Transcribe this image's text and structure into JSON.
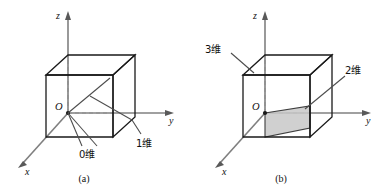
{
  "figure": {
    "background_color": "#ffffff",
    "line_color": "#1a1a1a",
    "axis_color": "#808080",
    "hidden_edge_color": "#8c8c8c",
    "plane_fill_color": "#c8c8c8",
    "panels": [
      {
        "id": "panel-a",
        "caption": "(a)",
        "axes": {
          "z_label": "z",
          "y_label": "y",
          "x_label": "x"
        },
        "origin_label": "O",
        "annotations": [
          {
            "id": "zero-dim",
            "label": "0维"
          },
          {
            "id": "one-dim",
            "label": "1维"
          }
        ]
      },
      {
        "id": "panel-b",
        "caption": "(b)",
        "axes": {
          "z_label": "z",
          "y_label": "y",
          "x_label": "x"
        },
        "origin_label": "O",
        "annotations": [
          {
            "id": "three-dim",
            "label": "3维"
          },
          {
            "id": "two-dim",
            "label": "2维"
          }
        ]
      }
    ]
  }
}
